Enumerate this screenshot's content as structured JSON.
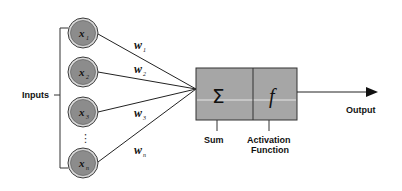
{
  "diagram": {
    "inputs_label": "Inputs",
    "inputs": [
      {
        "symbol": "x",
        "subscript": "1",
        "weight_symbol": "w",
        "weight_subscript": "1"
      },
      {
        "symbol": "x",
        "subscript": "2",
        "weight_symbol": "w",
        "weight_subscript": "2"
      },
      {
        "symbol": "x",
        "subscript": "3",
        "weight_symbol": "w",
        "weight_subscript": "3"
      },
      {
        "symbol": "x",
        "subscript": "n",
        "weight_symbol": "w",
        "weight_subscript": "n"
      }
    ],
    "ellipsis": "⋮",
    "sum_block": {
      "symbol": "Σ",
      "label": "Sum"
    },
    "activation_block": {
      "symbol": "f",
      "label_line1": "Activation",
      "label_line2": "Function"
    },
    "output_label": "Output",
    "colors": {
      "node_fill": "#8c8c8c",
      "node_ring": "#d9d9d9",
      "node_stroke": "#3a3a3a",
      "box_fill": "#a6a6a6",
      "box_highlight": "#e6e6e6",
      "line": "#222222",
      "background": "#ffffff"
    }
  }
}
